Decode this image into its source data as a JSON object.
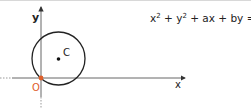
{
  "diagram": {
    "axes": {
      "x_label": "x",
      "y_label": "y",
      "origin_label": "O"
    },
    "circle": {
      "center_label": "C",
      "passes_through_origin": true
    },
    "equation": {
      "parts": [
        "x",
        "2",
        " + y",
        "2",
        " + ax + by = 0"
      ],
      "full": "x² + y² + ax + by = 0"
    },
    "colors": {
      "stroke": "#222222",
      "origin": "#e0602a"
    }
  }
}
